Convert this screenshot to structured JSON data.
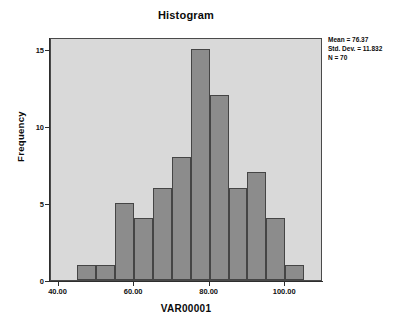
{
  "chart_data": {
    "type": "bar",
    "title": "Histogram",
    "xlabel": "VAR00001",
    "ylabel": "Frequency",
    "xlim": [
      38,
      110
    ],
    "ylim": [
      0,
      15.8
    ],
    "grid": false,
    "legend": null,
    "bin_width": 5,
    "categories": [
      "45-50",
      "50-55",
      "55-60",
      "60-65",
      "65-70",
      "70-75",
      "75-80",
      "80-85",
      "85-90",
      "90-95",
      "95-100",
      "100-105"
    ],
    "bin_starts": [
      45,
      50,
      55,
      60,
      65,
      70,
      75,
      80,
      85,
      90,
      95,
      100
    ],
    "values": [
      1,
      1,
      5,
      4,
      6,
      8,
      15,
      12,
      6,
      7,
      4,
      1
    ],
    "x_ticks": [
      40,
      60,
      80,
      100
    ],
    "x_tick_labels": [
      "40.00",
      "60.00",
      "80.00",
      "100.00"
    ],
    "y_ticks": [
      0,
      5,
      10,
      15
    ],
    "y_tick_labels": [
      "0",
      "5",
      "10",
      "15"
    ],
    "annotations": {
      "mean_label": "Mean = 76.37",
      "std_dev_label": "Std. Dev. = 11.832",
      "n_label": "N = 70",
      "mean": 76.37,
      "std_dev": 11.832,
      "n": 70
    }
  },
  "colors": {
    "plot_background": "#d9d9d9",
    "bar_fill": "#8c8c8c",
    "bar_outline": "#454545",
    "axis": "#2d2d2d",
    "text": "#0a0a0a",
    "page_background": "#ffffff"
  }
}
